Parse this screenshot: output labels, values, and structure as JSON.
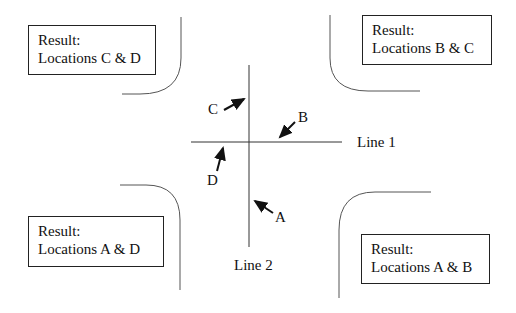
{
  "diagram": {
    "type": "intersection-location-diagram",
    "lines": {
      "line1": {
        "label": "Line 1",
        "orientation": "horizontal"
      },
      "line2": {
        "label": "Line 2",
        "orientation": "vertical"
      }
    },
    "locations": [
      {
        "id": "A",
        "label": "A",
        "position": "on Line 2, below intersection"
      },
      {
        "id": "B",
        "label": "B",
        "position": "on Line 1, right of intersection"
      },
      {
        "id": "C",
        "label": "C",
        "position": "on Line 2, above intersection"
      },
      {
        "id": "D",
        "label": "D",
        "position": "on Line 1, left of intersection"
      }
    ],
    "results": {
      "top_left": {
        "title": "Result:",
        "text": "Locations C & D"
      },
      "top_right": {
        "title": "Result:",
        "text": "Locations B & C"
      },
      "bottom_left": {
        "title": "Result:",
        "text": "Locations A & D"
      },
      "bottom_right": {
        "title": "Result:",
        "text": "Locations A & B"
      }
    },
    "colors": {
      "stroke": "#222222",
      "background": "#ffffff"
    }
  }
}
